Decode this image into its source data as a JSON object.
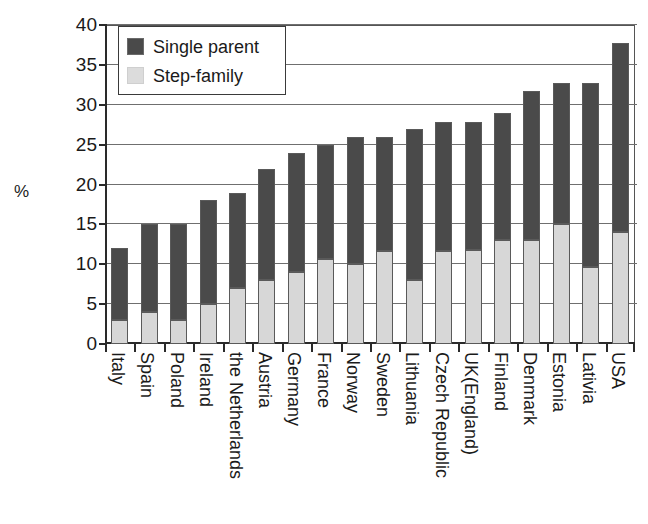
{
  "chart_data": {
    "type": "bar",
    "subtype": "stacked-vertical",
    "title": "",
    "xlabel": "",
    "ylabel": "%",
    "ylim": [
      0,
      40
    ],
    "yticks": [
      0,
      5,
      10,
      15,
      20,
      25,
      30,
      35,
      40
    ],
    "grid": true,
    "legend_position": "top-left-inside",
    "categories": [
      "Italy",
      "Spain",
      "Poland",
      "Ireland",
      "the Netherlands",
      "Austria",
      "Germany",
      "France",
      "Norway",
      "Sweden",
      "Lithuania",
      "Czech Republic",
      "UK(England)",
      "Finland",
      "Denmark",
      "Estonia",
      "Lativia",
      "USA"
    ],
    "series": [
      {
        "name": "Step-family",
        "color": "#d7d7d7",
        "values": [
          3,
          4,
          3,
          5,
          7,
          8,
          9,
          10.7,
          10,
          11.7,
          8,
          11.7,
          11.8,
          13,
          13,
          15,
          9.7,
          14
        ]
      },
      {
        "name": "Single parent",
        "color": "#4a4a4a",
        "values": [
          9,
          11,
          12,
          13,
          12,
          14,
          15,
          14.3,
          16,
          14.3,
          19,
          16.1,
          16,
          16,
          18.7,
          17.7,
          23,
          23.8
        ]
      }
    ],
    "totals": [
      12,
      15,
      15,
      18,
      19,
      22,
      24,
      25,
      26,
      26,
      27,
      27.8,
      27.8,
      29,
      31.7,
      32.7,
      32.7,
      37.8
    ],
    "annotations": []
  },
  "legend": {
    "items": [
      {
        "label": "Single parent",
        "swatch": "dark-gray-swatch-icon"
      },
      {
        "label": "Step-family",
        "swatch": "light-gray-swatch-icon"
      }
    ]
  },
  "axes": {
    "y_title": "%",
    "y_tick_labels": [
      "40",
      "35",
      "30",
      "25",
      "20",
      "15",
      "10",
      "5",
      "0"
    ]
  },
  "colors": {
    "single_parent": "#4a4a4a",
    "step_family": "#d7d7d7",
    "axis": "#2a2a2a",
    "gridline": "#6f6f6f",
    "text": "#1a1a1a",
    "background": "#ffffff"
  }
}
